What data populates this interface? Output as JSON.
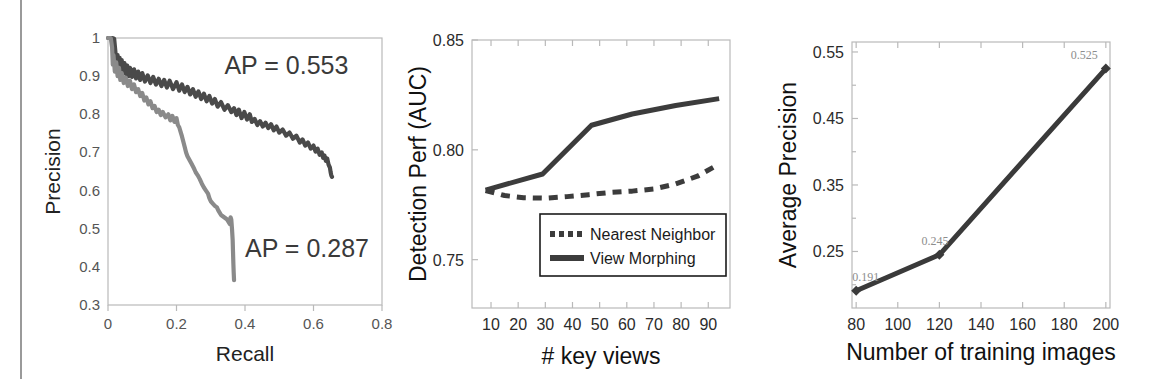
{
  "figure": {
    "name": "three-panel-results-figure",
    "background": "#ffffff",
    "left_rule_color": "#9a9a9a"
  },
  "chart_data": [
    {
      "id": "precision-recall",
      "type": "line",
      "title": "",
      "xlabel": "Recall",
      "ylabel": "Precision",
      "xlim": [
        0,
        0.8
      ],
      "ylim": [
        0.3,
        1.0
      ],
      "xticks": [
        "0",
        "0.2",
        "0.4",
        "0.6",
        "0.8"
      ],
      "xtick_values": [
        0,
        0.2,
        0.4,
        0.6,
        0.8
      ],
      "yticks": [
        "0.3",
        "0.4",
        "0.5",
        "0.6",
        "0.7",
        "0.8",
        "0.9",
        "1"
      ],
      "ytick_values": [
        0.3,
        0.4,
        0.5,
        0.6,
        0.7,
        0.8,
        0.9,
        1.0
      ],
      "grid": false,
      "legend": "none",
      "annotations": [
        {
          "text": "AP = 0.553",
          "color": "#4a4a4a",
          "x": 0.34,
          "y": 0.905
        },
        {
          "text": "AP = 0.287",
          "color": "#8a8a8a",
          "x": 0.4,
          "y": 0.425
        }
      ],
      "series": [
        {
          "name": "AP = 0.553",
          "color": "#4a4a4a",
          "style": "solid",
          "points": [
            [
              0.0,
              1.0
            ],
            [
              0.012,
              1.0
            ],
            [
              0.018,
              0.998
            ],
            [
              0.022,
              0.96
            ],
            [
              0.024,
              0.935
            ],
            [
              0.028,
              0.955
            ],
            [
              0.031,
              0.925
            ],
            [
              0.034,
              0.948
            ],
            [
              0.037,
              0.918
            ],
            [
              0.04,
              0.942
            ],
            [
              0.044,
              0.912
            ],
            [
              0.048,
              0.934
            ],
            [
              0.052,
              0.906
            ],
            [
              0.056,
              0.928
            ],
            [
              0.06,
              0.9
            ],
            [
              0.064,
              0.922
            ],
            [
              0.07,
              0.898
            ],
            [
              0.076,
              0.918
            ],
            [
              0.082,
              0.894
            ],
            [
              0.088,
              0.912
            ],
            [
              0.094,
              0.89
            ],
            [
              0.1,
              0.908
            ],
            [
              0.108,
              0.886
            ],
            [
              0.116,
              0.902
            ],
            [
              0.124,
              0.882
            ],
            [
              0.132,
              0.898
            ],
            [
              0.14,
              0.878
            ],
            [
              0.148,
              0.893
            ],
            [
              0.156,
              0.874
            ],
            [
              0.164,
              0.89
            ],
            [
              0.172,
              0.87
            ],
            [
              0.18,
              0.888
            ],
            [
              0.19,
              0.866
            ],
            [
              0.2,
              0.884
            ],
            [
              0.208,
              0.862
            ],
            [
              0.216,
              0.878
            ],
            [
              0.224,
              0.858
            ],
            [
              0.232,
              0.872
            ],
            [
              0.24,
              0.852
            ],
            [
              0.248,
              0.866
            ],
            [
              0.256,
              0.846
            ],
            [
              0.264,
              0.86
            ],
            [
              0.272,
              0.84
            ],
            [
              0.28,
              0.854
            ],
            [
              0.288,
              0.834
            ],
            [
              0.296,
              0.848
            ],
            [
              0.304,
              0.828
            ],
            [
              0.312,
              0.84
            ],
            [
              0.32,
              0.82
            ],
            [
              0.33,
              0.832
            ],
            [
              0.34,
              0.812
            ],
            [
              0.35,
              0.824
            ],
            [
              0.36,
              0.806
            ],
            [
              0.368,
              0.816
            ],
            [
              0.375,
              0.798
            ],
            [
              0.382,
              0.812
            ],
            [
              0.39,
              0.79
            ],
            [
              0.398,
              0.806
            ],
            [
              0.406,
              0.786
            ],
            [
              0.414,
              0.8
            ],
            [
              0.42,
              0.78
            ],
            [
              0.428,
              0.788
            ],
            [
              0.436,
              0.772
            ],
            [
              0.444,
              0.782
            ],
            [
              0.452,
              0.768
            ],
            [
              0.46,
              0.778
            ],
            [
              0.468,
              0.764
            ],
            [
              0.476,
              0.774
            ],
            [
              0.484,
              0.758
            ],
            [
              0.492,
              0.768
            ],
            [
              0.5,
              0.752
            ],
            [
              0.51,
              0.76
            ],
            [
              0.52,
              0.744
            ],
            [
              0.53,
              0.752
            ],
            [
              0.54,
              0.736
            ],
            [
              0.55,
              0.744
            ],
            [
              0.56,
              0.726
            ],
            [
              0.568,
              0.734
            ],
            [
              0.576,
              0.718
            ],
            [
              0.584,
              0.726
            ],
            [
              0.592,
              0.71
            ],
            [
              0.6,
              0.718
            ],
            [
              0.606,
              0.702
            ],
            [
              0.612,
              0.71
            ],
            [
              0.618,
              0.694
            ],
            [
              0.624,
              0.7
            ],
            [
              0.628,
              0.686
            ],
            [
              0.632,
              0.692
            ],
            [
              0.636,
              0.678
            ],
            [
              0.64,
              0.684
            ],
            [
              0.644,
              0.668
            ],
            [
              0.648,
              0.66
            ],
            [
              0.65,
              0.648
            ],
            [
              0.652,
              0.64
            ],
            [
              0.654,
              0.636
            ]
          ]
        },
        {
          "name": "AP = 0.287",
          "color": "#8a8a8a",
          "style": "solid",
          "points": [
            [
              0.0,
              1.0
            ],
            [
              0.008,
              1.0
            ],
            [
              0.012,
              0.975
            ],
            [
              0.014,
              0.93
            ],
            [
              0.016,
              0.955
            ],
            [
              0.02,
              0.912
            ],
            [
              0.024,
              0.936
            ],
            [
              0.028,
              0.9
            ],
            [
              0.032,
              0.922
            ],
            [
              0.036,
              0.89
            ],
            [
              0.04,
              0.908
            ],
            [
              0.046,
              0.882
            ],
            [
              0.052,
              0.896
            ],
            [
              0.058,
              0.874
            ],
            [
              0.064,
              0.888
            ],
            [
              0.07,
              0.866
            ],
            [
              0.076,
              0.878
            ],
            [
              0.082,
              0.858
            ],
            [
              0.088,
              0.866
            ],
            [
              0.094,
              0.848
            ],
            [
              0.1,
              0.856
            ],
            [
              0.106,
              0.836
            ],
            [
              0.112,
              0.844
            ],
            [
              0.118,
              0.826
            ],
            [
              0.124,
              0.834
            ],
            [
              0.13,
              0.816
            ],
            [
              0.136,
              0.822
            ],
            [
              0.142,
              0.806
            ],
            [
              0.148,
              0.812
            ],
            [
              0.154,
              0.798
            ],
            [
              0.16,
              0.806
            ],
            [
              0.168,
              0.792
            ],
            [
              0.176,
              0.8
            ],
            [
              0.182,
              0.784
            ],
            [
              0.188,
              0.796
            ],
            [
              0.194,
              0.78
            ],
            [
              0.2,
              0.79
            ],
            [
              0.204,
              0.772
            ],
            [
              0.208,
              0.766
            ],
            [
              0.212,
              0.754
            ],
            [
              0.216,
              0.742
            ],
            [
              0.22,
              0.728
            ],
            [
              0.224,
              0.714
            ],
            [
              0.228,
              0.7
            ],
            [
              0.232,
              0.69
            ],
            [
              0.238,
              0.68
            ],
            [
              0.244,
              0.67
            ],
            [
              0.25,
              0.66
            ],
            [
              0.256,
              0.648
            ],
            [
              0.262,
              0.64
            ],
            [
              0.268,
              0.63
            ],
            [
              0.274,
              0.618
            ],
            [
              0.28,
              0.608
            ],
            [
              0.286,
              0.6
            ],
            [
              0.292,
              0.592
            ],
            [
              0.296,
              0.58
            ],
            [
              0.3,
              0.572
            ],
            [
              0.306,
              0.566
            ],
            [
              0.312,
              0.56
            ],
            [
              0.318,
              0.556
            ],
            [
              0.322,
              0.548
            ],
            [
              0.326,
              0.542
            ],
            [
              0.33,
              0.536
            ],
            [
              0.336,
              0.532
            ],
            [
              0.342,
              0.528
            ],
            [
              0.348,
              0.524
            ],
            [
              0.352,
              0.518
            ],
            [
              0.356,
              0.512
            ],
            [
              0.358,
              0.53
            ],
            [
              0.36,
              0.524
            ],
            [
              0.362,
              0.5
            ],
            [
              0.364,
              0.47
            ],
            [
              0.365,
              0.44
            ],
            [
              0.366,
              0.41
            ],
            [
              0.367,
              0.385
            ],
            [
              0.368,
              0.365
            ]
          ]
        }
      ]
    },
    {
      "id": "detection-perf-vs-key-views",
      "type": "line",
      "title": "",
      "xlabel": "# key views",
      "ylabel": "Detection Perf (AUC)",
      "xlim": [
        3,
        98
      ],
      "ylim": [
        0.728,
        0.85
      ],
      "xticks": [
        "10",
        "20",
        "30",
        "40",
        "50",
        "60",
        "70",
        "80",
        "90"
      ],
      "xtick_values": [
        10,
        20,
        30,
        40,
        50,
        60,
        70,
        80,
        90
      ],
      "yticks": [
        "0.75",
        "0.80",
        "0.85"
      ],
      "ytick_values": [
        0.75,
        0.8,
        0.85
      ],
      "grid": false,
      "legend": "inside-bottom-center",
      "legend_entries": [
        {
          "label": "Nearest Neighbor",
          "style": "dashed",
          "color": "#3c3c3c"
        },
        {
          "label": "View Morphing",
          "style": "solid",
          "color": "#3c3c3c"
        }
      ],
      "series": [
        {
          "name": "Nearest Neighbor",
          "color": "#3c3c3c",
          "style": "dashed",
          "x": [
            8,
            15,
            22,
            30,
            38,
            46,
            54,
            62,
            70,
            78,
            86,
            94
          ],
          "y": [
            0.7815,
            0.7792,
            0.7782,
            0.778,
            0.7787,
            0.7796,
            0.7806,
            0.7812,
            0.7822,
            0.7845,
            0.788,
            0.7935
          ]
        },
        {
          "name": "View Morphing",
          "color": "#3c3c3c",
          "style": "solid",
          "x": [
            8,
            29,
            47,
            62,
            78,
            94
          ],
          "y": [
            0.7817,
            0.789,
            0.8112,
            0.8163,
            0.8202,
            0.8233
          ]
        }
      ]
    },
    {
      "id": "average-precision-vs-training-images",
      "type": "line",
      "title": "",
      "xlabel": "Number of training images",
      "ylabel": "Average Precision",
      "xlim": [
        78,
        202
      ],
      "ylim": [
        0.165,
        0.565
      ],
      "xticks": [
        "80",
        "100",
        "120",
        "140",
        "160",
        "180",
        "200"
      ],
      "xtick_values": [
        80,
        100,
        120,
        140,
        160,
        180,
        200
      ],
      "yticks": [
        "0.25",
        "0.35",
        "0.45",
        "0.55"
      ],
      "ytick_values": [
        0.25,
        0.35,
        0.45,
        0.55
      ],
      "grid": false,
      "legend": "none",
      "series": [
        {
          "name": "Average Precision",
          "color": "#3a3a3a",
          "style": "solid",
          "marker": "diamond",
          "x": [
            80,
            120,
            200
          ],
          "y": [
            0.191,
            0.245,
            0.525
          ],
          "data_labels": [
            "0.191",
            "0.245",
            "0.525"
          ]
        }
      ]
    }
  ]
}
